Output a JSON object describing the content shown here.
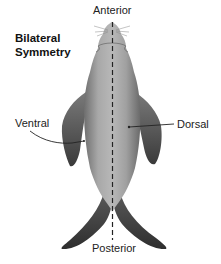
{
  "title": {
    "line1": "Bilateral",
    "line2": "Symmetry"
  },
  "labels": {
    "anterior": "Anterior",
    "posterior": "Posterior",
    "ventral": "Ventral",
    "dorsal": "Dorsal"
  },
  "figure": {
    "axis_line": "dashed-midline",
    "colors": {
      "body_light": "#b5b5b5",
      "body_mid": "#8c8c8c",
      "body_dark": "#4a4a4a",
      "flipper": "#5a5a5a",
      "line": "#222222",
      "background": "#ffffff"
    }
  }
}
